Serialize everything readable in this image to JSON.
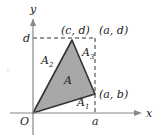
{
  "diagram": {
    "axes": {
      "x_label": "x",
      "y_label": "y",
      "origin_label": "O"
    },
    "ticks": {
      "x_tick": "a",
      "y_tick": "d"
    },
    "points": {
      "top_vertex": "(c, d)",
      "corner": "(a, d)",
      "right_vertex": "(a, b)"
    },
    "regions": {
      "triangle": "A",
      "a1_base": "A",
      "a1_sub": "1",
      "a2_base": "A",
      "a2_sub": "2",
      "a3_base": "A",
      "a3_sub": "3"
    },
    "colors": {
      "fill": "#a8a8a8",
      "stroke": "#333333",
      "axis": "#888888",
      "dash": "#333333"
    }
  }
}
